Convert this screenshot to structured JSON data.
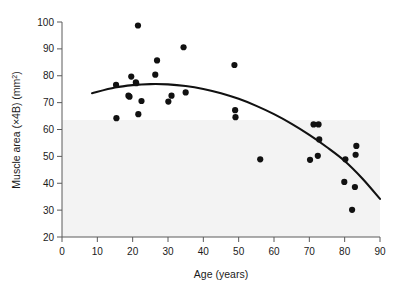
{
  "chart_data": {
    "type": "scatter",
    "title": "",
    "xlabel": "Age (years)",
    "ylabel": "Muscle area (×4B) (mm2)",
    "ylabel_main": "Muscle area (×4B) (mm",
    "ylabel_sup": "2",
    "ylabel_tail": ")",
    "xlim": [
      0,
      90
    ],
    "ylim": [
      20,
      100
    ],
    "xticks": [
      0,
      10,
      20,
      30,
      40,
      50,
      60,
      70,
      80,
      90
    ],
    "yticks": [
      20,
      30,
      40,
      50,
      60,
      70,
      80,
      90,
      100
    ],
    "xtick_labels": [
      "0",
      "10",
      "20",
      "30",
      "40",
      "50",
      "60",
      "70",
      "80",
      "90"
    ],
    "ytick_labels": [
      "20",
      "30",
      "40",
      "50",
      "60",
      "70",
      "80",
      "90",
      "100"
    ],
    "grid": false,
    "legend": null,
    "marker": {
      "shape": "circle",
      "color": "#111111",
      "size": 4.2
    },
    "points": [
      {
        "x": 15.3,
        "y": 76.6
      },
      {
        "x": 15.4,
        "y": 64.2
      },
      {
        "x": 18.8,
        "y": 72.6
      },
      {
        "x": 19.1,
        "y": 72.2
      },
      {
        "x": 19.6,
        "y": 79.7
      },
      {
        "x": 20.9,
        "y": 77.5
      },
      {
        "x": 21.0,
        "y": 77.2
      },
      {
        "x": 21.5,
        "y": 98.7
      },
      {
        "x": 21.6,
        "y": 65.7
      },
      {
        "x": 22.5,
        "y": 70.6
      },
      {
        "x": 26.4,
        "y": 80.4
      },
      {
        "x": 26.9,
        "y": 85.7
      },
      {
        "x": 30.1,
        "y": 70.4
      },
      {
        "x": 31.0,
        "y": 72.6
      },
      {
        "x": 34.4,
        "y": 90.6
      },
      {
        "x": 35.0,
        "y": 73.8
      },
      {
        "x": 48.8,
        "y": 84.0
      },
      {
        "x": 49.0,
        "y": 67.2
      },
      {
        "x": 49.1,
        "y": 64.6
      },
      {
        "x": 56.1,
        "y": 48.9
      },
      {
        "x": 70.2,
        "y": 48.7
      },
      {
        "x": 71.2,
        "y": 61.9
      },
      {
        "x": 72.4,
        "y": 50.2
      },
      {
        "x": 72.6,
        "y": 61.9
      },
      {
        "x": 72.8,
        "y": 56.3
      },
      {
        "x": 79.9,
        "y": 40.5
      },
      {
        "x": 80.2,
        "y": 48.9
      },
      {
        "x": 82.1,
        "y": 30.1
      },
      {
        "x": 82.9,
        "y": 38.6
      },
      {
        "x": 83.1,
        "y": 50.6
      },
      {
        "x": 83.3,
        "y": 53.9
      }
    ],
    "fit_curve": {
      "type": "quadratic",
      "label": "fitted quadratic regression line",
      "color": "#111111",
      "x_start": 8.5,
      "x_end": 90.0,
      "points": [
        {
          "x": 8.5,
          "y": 73.5
        },
        {
          "x": 15.0,
          "y": 75.6
        },
        {
          "x": 20.0,
          "y": 76.5
        },
        {
          "x": 25.0,
          "y": 76.9
        },
        {
          "x": 30.0,
          "y": 76.8
        },
        {
          "x": 35.0,
          "y": 76.2
        },
        {
          "x": 40.0,
          "y": 75.1
        },
        {
          "x": 45.0,
          "y": 73.5
        },
        {
          "x": 50.0,
          "y": 71.4
        },
        {
          "x": 55.0,
          "y": 68.8
        },
        {
          "x": 60.0,
          "y": 65.7
        },
        {
          "x": 65.0,
          "y": 62.1
        },
        {
          "x": 70.0,
          "y": 58.0
        },
        {
          "x": 75.0,
          "y": 53.4
        },
        {
          "x": 80.0,
          "y": 48.3
        },
        {
          "x": 85.0,
          "y": 41.8
        },
        {
          "x": 90.0,
          "y": 34.2
        }
      ]
    }
  },
  "axes": {
    "x_axis_name": "x-axis",
    "y_axis_name": "y-axis",
    "background_tint": "#f2f2f2",
    "axis_color": "#555555"
  }
}
